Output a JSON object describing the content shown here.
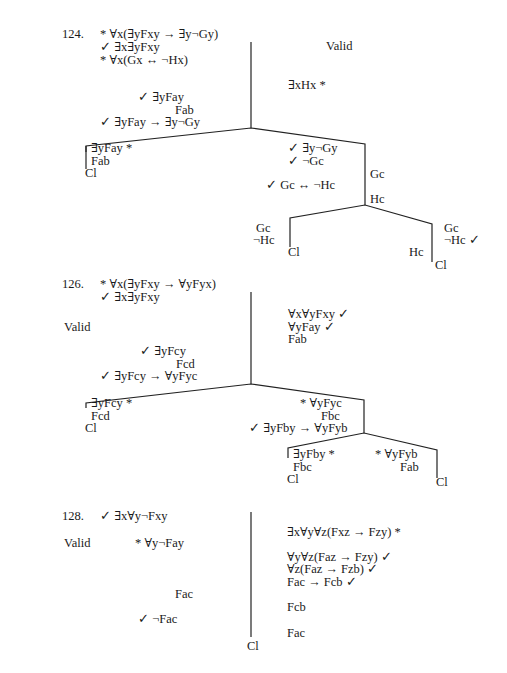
{
  "problems": [
    {
      "number": "124.",
      "verdict": "Valid",
      "premises": [
        "* ∀x(∃yFxy → ∃y¬Gy)",
        "✓ ∃x∃yFxy",
        "* ∀x(Gx ↔ ¬Hx)"
      ],
      "right_trunk": [
        "∃xHx  *"
      ],
      "left_trunk": [
        "✓ ∃yFay",
        "Fab",
        "✓ ∃yFay → ∃y¬Gy"
      ],
      "branch_left": [
        "∃yFay *",
        "Fab",
        "Cl"
      ],
      "branch_right": [
        "✓ ∃y¬Gy",
        "✓ ¬Gc",
        "✓ Gc ↔ ¬Hc",
        "Gc",
        "Hc"
      ],
      "sub_left": [
        "Gc",
        "¬Hc",
        "Cl"
      ],
      "sub_right": [
        "Gc",
        "¬Hc ✓",
        "Hc",
        "Cl"
      ]
    },
    {
      "number": "126.",
      "verdict": "Valid",
      "premises": [
        "* ∀x(∃yFxy → ∀yFyx)",
        "✓ ∃x∃yFxy"
      ],
      "right_trunk": [
        "∀x∀yFxy  ✓",
        "∀yFay  ✓",
        "Fab"
      ],
      "left_trunk": [
        "✓ ∃yFcy",
        "Fcd",
        "✓ ∃yFcy  → ∀yFyc"
      ],
      "branch_left": [
        "∃yFcy  *",
        "Fcd",
        "Cl"
      ],
      "branch_right": [
        "*  ∀yFyc",
        "Fbc",
        "✓ ∃yFby → ∀yFyb"
      ],
      "sub_left": [
        "∃yFby *",
        "Fbc",
        "Cl"
      ],
      "sub_right": [
        "*  ∀yFyb",
        "Fab",
        "Cl"
      ]
    },
    {
      "number": "128.",
      "verdict": "Valid",
      "left_trunk": [
        "✓ ∃x∀y¬Fxy",
        "* ∀y¬Fay",
        "Fac",
        "✓ ¬Fac",
        "Cl"
      ],
      "right_trunk": [
        "∃x∀y∀z(Fxz → Fzy)  *",
        "∀y∀z(Faz → Fzy)  ✓",
        "∀z(Faz → Fzb)  ✓",
        "Fac → Fcb  ✓",
        "Fcb",
        "Fac"
      ]
    }
  ]
}
